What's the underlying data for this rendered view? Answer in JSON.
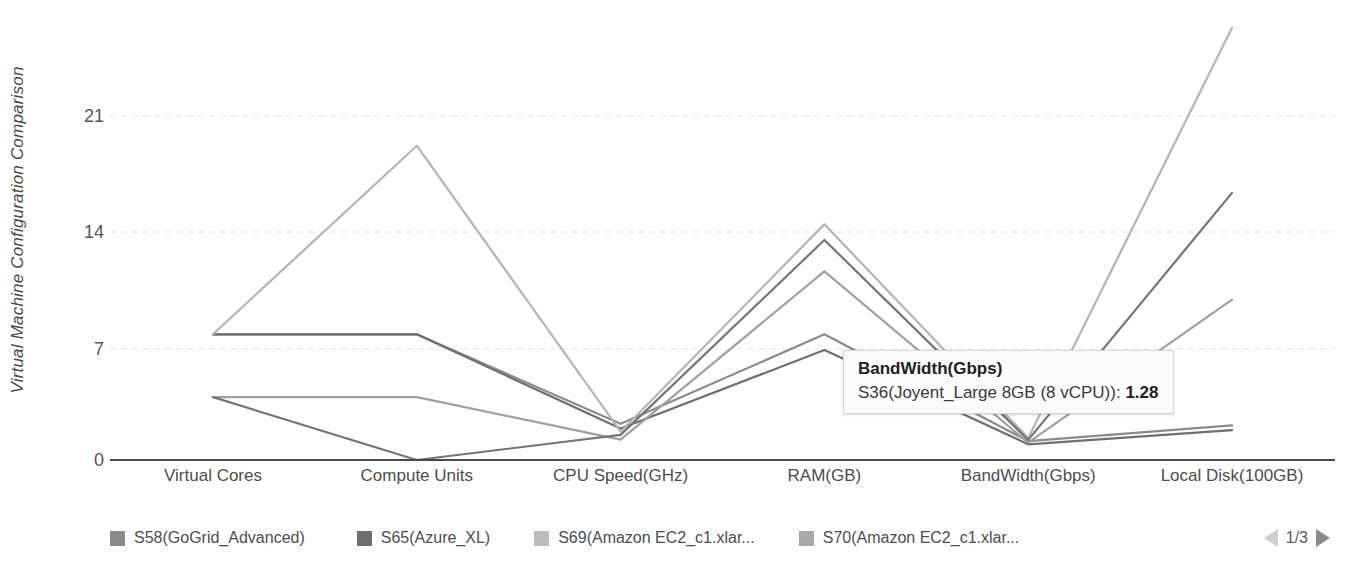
{
  "chart_data": {
    "type": "line",
    "title": "",
    "ylabel": "Virtual Machine Configuration Comparison",
    "xlabel": "",
    "categories": [
      "Virtual Cores",
      "Compute Units",
      "CPU Speed(GHz)",
      "RAM(GB)",
      "BandWidth(Gbps)",
      "Local Disk(100GB)"
    ],
    "yticks": [
      0,
      7,
      14,
      21
    ],
    "ylim": [
      0,
      28
    ],
    "grid": true,
    "legend_position": "bottom",
    "series": [
      {
        "name": "S58(GoGrid_Advanced)",
        "color": "#8a8a8a",
        "values": [
          8,
          8,
          2.3,
          8,
          1.2,
          2.2
        ]
      },
      {
        "name": "S65(Azure_XL)",
        "color": "#6f6f6f",
        "values": [
          8,
          8,
          2.0,
          7,
          1.0,
          1.9
        ]
      },
      {
        "name": "S69(Amazon EC2_c1.xlar...",
        "color": "#b4b4b4",
        "values": [
          8,
          20,
          1.8,
          15,
          1.4,
          27.5
        ]
      },
      {
        "name": "S70(Amazon EC2_c1.xlar...",
        "color": "#a0a0a0",
        "values": [
          4,
          4,
          1.3,
          12,
          1.1,
          10.2
        ]
      },
      {
        "name": "S36(Joyent_Large 8GB (8 vCPU))",
        "color": "#757575",
        "values": [
          4,
          0,
          1.6,
          14,
          1.28,
          17.0
        ]
      }
    ],
    "annotations": [
      {
        "type": "tooltip",
        "category": "BandWidth(Gbps)",
        "series": "S36(Joyent_Large 8GB (8 vCPU))",
        "value": "1.28"
      }
    ]
  },
  "y_axis": {
    "title": "Virtual Machine Configuration Comparison",
    "ticks": [
      "21",
      "14",
      "7",
      "0"
    ]
  },
  "x_axis": {
    "labels": [
      "Virtual Cores",
      "Compute Units",
      "CPU Speed(GHz)",
      "RAM(GB)",
      "BandWidth(Gbps)",
      "Local Disk(100GB)"
    ]
  },
  "legend": {
    "items": [
      {
        "label": "S58(GoGrid_Advanced)",
        "color": "#8a8a8a"
      },
      {
        "label": "S65(Azure_XL)",
        "color": "#6f6f6f"
      },
      {
        "label": "S69(Amazon EC2_c1.xlar...",
        "color": "#bcbcbc"
      },
      {
        "label": "S70(Amazon EC2_c1.xlar...",
        "color": "#a8a8a8"
      }
    ],
    "pager": {
      "text": "1/3",
      "prev_icon": "triangle-left-icon",
      "next_icon": "triangle-right-icon"
    }
  },
  "tooltip": {
    "title": "BandWidth(Gbps)",
    "series_label": "S36(Joyent_Large 8GB (8 vCPU)):",
    "value": "1.28"
  },
  "colors": {
    "axis": "#555555",
    "grid": "#e2e2e2",
    "text": "#4d4d4d"
  }
}
